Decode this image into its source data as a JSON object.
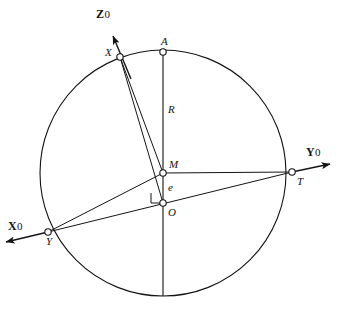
{
  "figure": {
    "type": "geometry-diagram",
    "background_color": "#ffffff",
    "stroke_color": "#141414",
    "circle": {
      "cx": 163,
      "cy": 173,
      "r": 123
    },
    "points": [
      {
        "id": "A",
        "label": "A",
        "x": 163,
        "y": 52,
        "marker": "open-circle",
        "label_dx": -2,
        "label_dy": -16
      },
      {
        "id": "X",
        "label": "X",
        "x": 120,
        "y": 57,
        "marker": "open-circle",
        "label_dx": -15,
        "label_dy": -10
      },
      {
        "id": "M",
        "label": "M",
        "x": 163,
        "y": 173,
        "marker": "open-circle",
        "label_dx": 6,
        "label_dy": -14
      },
      {
        "id": "O",
        "label": "O",
        "x": 163,
        "y": 203,
        "marker": "open-circle",
        "label_dx": 5,
        "label_dy": 4
      },
      {
        "id": "T",
        "label": "T",
        "x": 292,
        "y": 172,
        "marker": "open-circle",
        "label_dx": 5,
        "label_dy": 4
      },
      {
        "id": "Y",
        "label": "Y",
        "x": 48,
        "y": 232,
        "marker": "open-circle",
        "label_dx": -2,
        "label_dy": 4
      }
    ],
    "segment_labels": [
      {
        "id": "R",
        "label": "R",
        "x": 168,
        "y": 104
      },
      {
        "id": "e",
        "label": "e",
        "x": 168,
        "y": 182
      }
    ],
    "axes": [
      {
        "id": "Z0",
        "letter": "Z",
        "zero": "0",
        "label_x": 96,
        "label_y": 8,
        "tip_x": 113,
        "tip_y": 38,
        "tail_x": 131,
        "tail_y": 76
      },
      {
        "id": "Y0",
        "letter": "Y",
        "zero": "0",
        "label_x": 306,
        "label_y": 146,
        "tip_x": 332,
        "tip_y": 164,
        "tail_x": 163,
        "tail_y": 173
      },
      {
        "id": "X0",
        "letter": "X",
        "zero": "0",
        "label_x": 8,
        "label_y": 220,
        "tip_x": 4,
        "tip_y": 243,
        "tail_x": 163,
        "tail_y": 203
      }
    ],
    "right_angle": {
      "x": 151,
      "y": 192,
      "size": 10
    },
    "edges": [
      {
        "from": "A",
        "to": "bottom-of-circle",
        "note": "vertical diameter through M and O"
      },
      {
        "from": "X",
        "to": "M"
      },
      {
        "from": "X",
        "to": "O"
      },
      {
        "from": "M",
        "to": "T"
      },
      {
        "from": "Y",
        "to": "M"
      },
      {
        "from": "Y",
        "to": "T",
        "note": "passes through O"
      }
    ]
  }
}
